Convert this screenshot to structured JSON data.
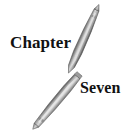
{
  "page": {
    "title": "Chapter Seven",
    "background_color": "#ffffff",
    "width": 133,
    "height": 139
  },
  "heading": {
    "chapter_word": "Chapter",
    "number_word": "Seven",
    "text_color": "#111111"
  },
  "illustration": {
    "description": "two crossed tapered metal pen-like implements",
    "objects": [
      {
        "name": "upper-pen",
        "orientation": "diagonal, tip upper-right to tip lower-left",
        "tip_top": [
          97,
          9
        ],
        "tip_bottom": [
          68,
          74
        ],
        "highlight_color": "#d2d2d2",
        "mid_color": "#a8a8a8",
        "shadow_color": "#6e6e6e",
        "outline_color": "#5a5a5a"
      },
      {
        "name": "lower-pen",
        "orientation": "diagonal, tip upper-left to squared end lower-right",
        "tip_top": [
          36,
          73
        ],
        "end_bottom": [
          80,
          126
        ],
        "highlight_color": "#d8d8d8",
        "mid_color": "#b0b0b0",
        "shadow_color": "#767676",
        "outline_color": "#626262"
      }
    ]
  }
}
